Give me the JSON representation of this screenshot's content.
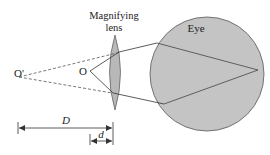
{
  "diagram": {
    "title_label_lens_line1": "Magnifying",
    "title_label_lens_line2": "lens",
    "eye_label": "Eye",
    "object_label": "O",
    "image_label": "O'",
    "distance_D_label": "D",
    "distance_d_label": "d",
    "colors": {
      "fill": "#c4c4c4",
      "stroke": "#555555",
      "line": "#333333",
      "background": "#ffffff"
    }
  }
}
